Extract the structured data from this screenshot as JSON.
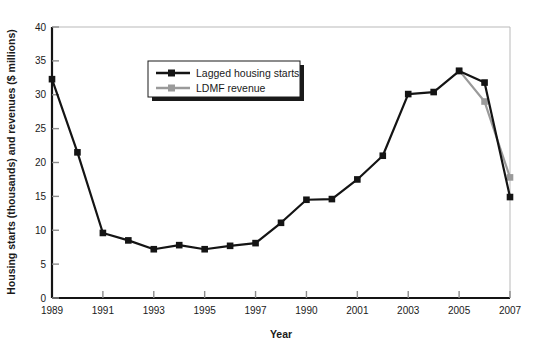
{
  "chart_data": {
    "type": "line",
    "title": "",
    "xlabel": "Year",
    "ylabel": "Housing starts (thousands) and revenues ($ millions)",
    "xlim": [
      1989,
      2007
    ],
    "ylim": [
      0,
      40
    ],
    "yticks": [
      0,
      5,
      10,
      15,
      20,
      25,
      30,
      35,
      40
    ],
    "xticks": [
      1989,
      1991,
      1993,
      1995,
      1997,
      1990,
      2001,
      2003,
      2005,
      2007
    ],
    "xtick_labels": [
      "1989",
      "1991",
      "1993",
      "1995",
      "1997",
      "1990",
      "2001",
      "2003",
      "2005",
      "2007"
    ],
    "x": [
      1989,
      1990,
      1991,
      1992,
      1993,
      1994,
      1995,
      1996,
      1997,
      1998,
      1999,
      2000,
      2001,
      2002,
      2003,
      2004,
      2005,
      2006,
      2007
    ],
    "grid": false,
    "legend_position": "upper-left-inset",
    "series": [
      {
        "name": "Lagged housing starts",
        "color": "#141414",
        "marker": "square",
        "x": [
          1989,
          1990,
          1991,
          1992,
          1993,
          1994,
          1995,
          1996,
          1997,
          1998,
          1999,
          2000,
          2001,
          2002,
          2003,
          2004,
          2005,
          2006,
          2007
        ],
        "values": [
          32.3,
          21.5,
          9.6,
          8.5,
          7.2,
          7.8,
          7.2,
          7.7,
          8.1,
          11.1,
          14.5,
          14.6,
          17.5,
          21.0,
          30.1,
          30.4,
          33.5,
          31.8,
          14.9
        ]
      },
      {
        "name": "LDMF revenue",
        "color": "#9a9a9a",
        "marker": "square",
        "x": [
          2005,
          2006,
          2007
        ],
        "values": [
          33.6,
          29.0,
          17.8
        ]
      }
    ]
  },
  "axes": {
    "y_title": "Housing starts (thousands) and revenues ($ millions)",
    "x_title": "Year"
  },
  "legend": {
    "items": [
      {
        "label": "Lagged housing starts",
        "color": "#141414"
      },
      {
        "label": "LDMF revenue",
        "color": "#9a9a9a"
      }
    ]
  },
  "colors": {
    "series_primary": "#141414",
    "series_secondary": "#9a9a9a",
    "frame_light": "#b9b9b9",
    "axis_dark": "#141414",
    "background": "#ffffff"
  }
}
